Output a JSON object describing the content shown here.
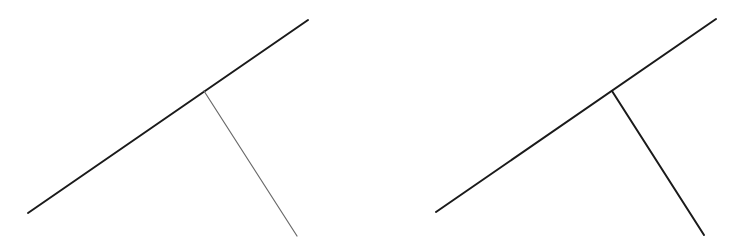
{
  "diagrams": [
    {
      "name": "left-figure",
      "main_line": {
        "x1": 28,
        "y1": 213,
        "x2": 308,
        "y2": 20,
        "color": "#1a1a1a",
        "width": 2
      },
      "branch_line": {
        "x1": 204,
        "y1": 91,
        "x2": 297,
        "y2": 236,
        "color": "#6a6a6a",
        "width": 1.2
      }
    },
    {
      "name": "right-figure",
      "main_line": {
        "x1": 436,
        "y1": 212,
        "x2": 716,
        "y2": 19,
        "color": "#1a1a1a",
        "width": 2
      },
      "branch_line": {
        "x1": 612,
        "y1": 91,
        "x2": 704,
        "y2": 235,
        "color": "#1a1a1a",
        "width": 2
      }
    }
  ]
}
